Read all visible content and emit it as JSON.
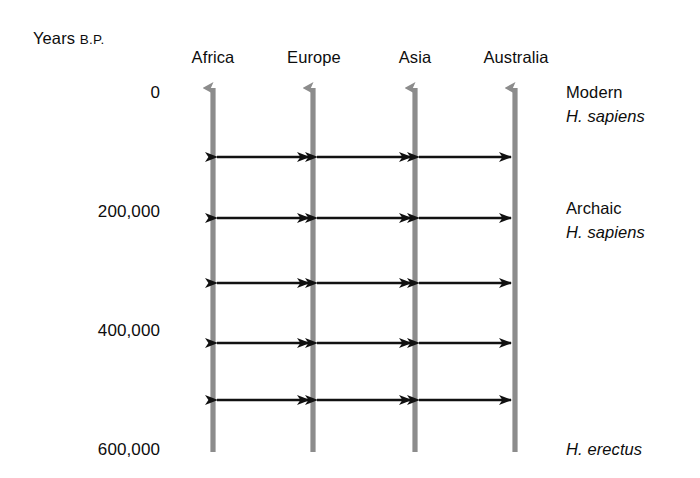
{
  "figure": {
    "type": "diagram",
    "axis_label": {
      "main": "Years",
      "suffix": "B.P."
    },
    "time_scale": {
      "unit": "years before present",
      "direction": "top = present (0), bottom = past (600,000)",
      "ticks": [
        {
          "label": "0",
          "y": 92
        },
        {
          "label": "200,000",
          "y": 211
        },
        {
          "label": "400,000",
          "y": 330
        },
        {
          "label": "600,000",
          "y": 449
        }
      ]
    },
    "columns": [
      {
        "label": "Africa",
        "x": 213
      },
      {
        "label": "Europe",
        "x": 313
      },
      {
        "label": "Asia",
        "x": 415
      },
      {
        "label": "Australia",
        "x": 515
      }
    ],
    "lineage_arrows": {
      "description": "vertical gray arrows pointing upward (toward the present) for each region",
      "color": "#8c8c8c",
      "count": 4,
      "top_y": 80,
      "bottom_y": 452
    },
    "gene_flow_arrows": {
      "description": "horizontal black double-headed arrows indicating gene flow between adjacent regions",
      "color": "#111111",
      "rows_y": [
        157,
        218,
        283,
        343,
        400
      ],
      "pairs": [
        [
          "Africa",
          "Europe"
        ],
        [
          "Europe",
          "Asia"
        ],
        [
          "Asia",
          "Australia"
        ]
      ],
      "total_count": 15
    },
    "stage_labels": [
      {
        "line1": "Modern",
        "line2": "H. sapiens",
        "y": 92
      },
      {
        "line1": "Archaic",
        "line2": "H. sapiens",
        "y": 208
      },
      {
        "line1": "",
        "line2": "H. erectus",
        "y": 449
      }
    ],
    "right_labels": {
      "modern": "Modern",
      "modern_species": "H. sapiens",
      "archaic": "Archaic",
      "archaic_species": "H. sapiens",
      "erectus_species": "H. erectus"
    },
    "colors": {
      "background": "#ffffff",
      "text": "#0d0d0d",
      "lineage_arrow": "#8c8c8c",
      "gene_flow_arrow": "#111111"
    }
  }
}
